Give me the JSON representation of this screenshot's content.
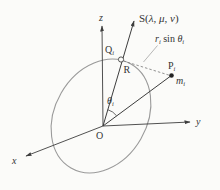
{
  "diagram": {
    "axes": {
      "x_label": "x",
      "y_label": "y",
      "z_label": "z"
    },
    "origin_label": "O",
    "s_ray_label": {
      "prefix": "S(",
      "args": "λ, μ, ν",
      "suffix": ")"
    },
    "distance_label": {
      "r": "r",
      "r_sub": "i",
      "mid": " sin ",
      "theta": "θ",
      "theta_sub": "i"
    },
    "q_point_label": {
      "main": "Q",
      "sub": "i"
    },
    "radius_label": "R",
    "p_point_label": {
      "main": "P",
      "sub": "i"
    },
    "mass_label": {
      "main": "m",
      "sub": "i"
    },
    "angle_label": {
      "main": "θ",
      "sub": "i"
    }
  },
  "colors": {
    "background": "#fbfbf9",
    "line": "#3d3d3d",
    "ellipse": "#9a9a9a",
    "text": "#333333"
  }
}
